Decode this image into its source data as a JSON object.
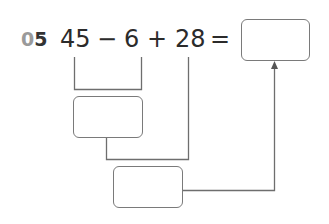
{
  "problem": {
    "number_prefix": "0",
    "number_suffix": "5",
    "terms": {
      "a": "45",
      "op1": "−",
      "b": "6",
      "op2": "+",
      "c": "28",
      "eq": "="
    },
    "answer_box": "",
    "intermediate_box": "",
    "final_box": ""
  },
  "colors": {
    "text": "#2b2b2b",
    "lines": "#6e6e6e",
    "dim_digit": "#9a9a9a"
  }
}
